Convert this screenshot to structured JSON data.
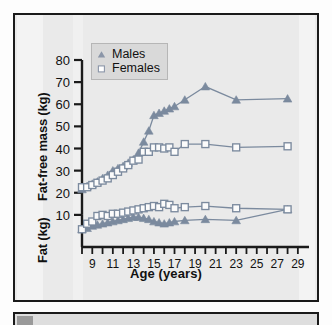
{
  "figure": {
    "background_color": "#eaeaea",
    "border_color": "#1a1a1a",
    "series_color": "#7b8a9e",
    "axis_color": "#1a1a1a"
  },
  "legend": {
    "position": "top-left-inside",
    "entries": [
      {
        "label": "Males",
        "marker": "triangle-up-marker"
      },
      {
        "label": "Females",
        "marker": "square-open-marker"
      }
    ]
  },
  "axes": {
    "y": {
      "titles": [
        "Fat-free mass (kg)",
        "Fat (kg)"
      ],
      "ticks": [
        10,
        20,
        30,
        40,
        50,
        60,
        70,
        80
      ],
      "limits": [
        0,
        80
      ]
    },
    "x": {
      "title": "Age (years)",
      "ticks": [
        8,
        9,
        10,
        11,
        12,
        13,
        14,
        15,
        16,
        17,
        18,
        19,
        20,
        21,
        22,
        23,
        24,
        25,
        26,
        27,
        28,
        29
      ],
      "labeled_ticks": [
        9,
        11,
        13,
        15,
        17,
        19,
        21,
        23,
        25,
        27,
        29
      ],
      "limits": [
        8,
        29.5
      ]
    }
  },
  "chart_data": {
    "type": "line",
    "title": "",
    "xlabel": "Age (years)",
    "ylabel": "Fat-free mass (kg) / Fat (kg)",
    "xlim": [
      8,
      29.5
    ],
    "ylim": [
      0,
      80
    ],
    "grid": false,
    "legend": [
      "Males",
      "Females"
    ],
    "legend_position": "upper left",
    "series": [
      {
        "name": "Fat-free mass, Males",
        "marker": "triangle-up-marker",
        "color": "#7b8a9e",
        "x": [
          8,
          8.5,
          9,
          9.5,
          10,
          10.5,
          11,
          11.5,
          12,
          12.5,
          13,
          13.5,
          14,
          14.5,
          15,
          15.5,
          16,
          16.5,
          17,
          18,
          20,
          23,
          28
        ],
        "y": [
          21.5,
          23,
          24,
          25,
          26.5,
          28,
          30,
          31,
          32,
          33.5,
          35,
          38,
          43,
          48,
          55,
          56,
          57,
          58,
          59,
          62,
          68,
          62,
          62.5
        ]
      },
      {
        "name": "Fat-free mass, Females",
        "marker": "square-open-marker",
        "color": "#7b8a9e",
        "x": [
          8,
          8.5,
          9,
          9.5,
          10,
          10.5,
          11,
          11.5,
          12,
          12.5,
          13,
          13.5,
          14,
          14.5,
          15,
          15.5,
          16,
          16.5,
          17,
          18,
          20,
          23,
          28
        ],
        "y": [
          22.5,
          22.5,
          23.5,
          24.5,
          25.5,
          26.5,
          28,
          29.5,
          31,
          32.5,
          34.5,
          35,
          38.5,
          38.5,
          40.5,
          40.5,
          40,
          40.5,
          38.5,
          42,
          42,
          40.5,
          41
        ]
      },
      {
        "name": "Fat, Males",
        "marker": "triangle-up-marker",
        "color": "#7b8a9e",
        "x": [
          8,
          8.5,
          9,
          9.5,
          10,
          10.5,
          11,
          11.5,
          12,
          12.5,
          13,
          13.5,
          14,
          14.5,
          15,
          15.5,
          16,
          16.5,
          17,
          18,
          20,
          23,
          28
        ],
        "y": [
          3.5,
          4,
          5,
          5.5,
          6,
          6.5,
          7,
          7.5,
          8,
          8.5,
          9,
          9,
          8.5,
          8,
          7,
          6.5,
          6,
          6.5,
          7,
          7.5,
          8,
          7.5,
          12.5
        ]
      },
      {
        "name": "Fat, Females",
        "marker": "square-open-marker",
        "color": "#7b8a9e",
        "x": [
          8,
          8.5,
          9,
          9.5,
          10,
          10.5,
          11,
          11.5,
          12,
          12.5,
          13,
          13.5,
          14,
          14.5,
          15,
          15.5,
          16,
          16.5,
          17,
          18,
          20,
          23,
          28
        ],
        "y": [
          3.5,
          6,
          7,
          9.5,
          10,
          9.5,
          10.5,
          10.5,
          11,
          11.5,
          12,
          12.5,
          13,
          13.5,
          14,
          13.5,
          15,
          14.5,
          13,
          13.5,
          14,
          13,
          12.5
        ]
      }
    ]
  }
}
